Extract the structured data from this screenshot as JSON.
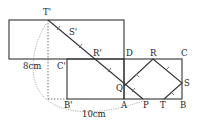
{
  "figure": {
    "type": "geometry diagram",
    "points": {
      "T_prime": "T'",
      "S_prime": "S'",
      "R_prime": "R'",
      "C_prime": "C'",
      "B_prime": "B'",
      "D": "D",
      "R": "R",
      "C": "C",
      "Q": "Q",
      "S": "S",
      "A": "A",
      "P": "P",
      "T": "T",
      "B": "B"
    },
    "measurements": {
      "left_length": "8cm",
      "arc_length": "10cm"
    },
    "colors": {
      "line": "#333333",
      "background": "#ffffff"
    }
  }
}
